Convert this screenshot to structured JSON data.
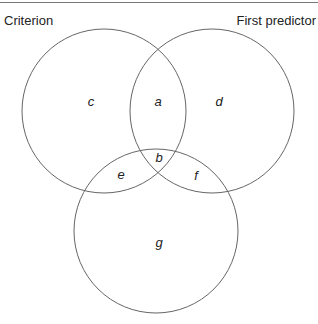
{
  "diagram": {
    "type": "venn",
    "sets": [
      {
        "name": "Criterion",
        "cx": 104,
        "cy": 111,
        "r": 82
      },
      {
        "name": "First predictor",
        "cx": 212,
        "cy": 111,
        "r": 82
      },
      {
        "name": "",
        "cx": 156,
        "cy": 231,
        "r": 82
      }
    ],
    "regions": [
      {
        "label": "c",
        "x": 91,
        "y": 106
      },
      {
        "label": "a",
        "x": 158,
        "y": 106
      },
      {
        "label": "d",
        "x": 219,
        "y": 106
      },
      {
        "label": "b",
        "x": 159,
        "y": 162
      },
      {
        "label": "e",
        "x": 121,
        "y": 179
      },
      {
        "label": "f",
        "x": 196,
        "y": 180
      },
      {
        "label": "g",
        "x": 159,
        "y": 247
      }
    ],
    "stroke_color": "#666666"
  },
  "titles": {
    "left": "Criterion",
    "right": "First predictor"
  }
}
